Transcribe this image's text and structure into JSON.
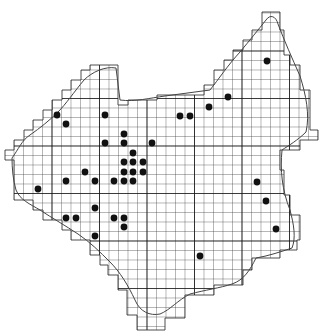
{
  "map": {
    "type": "grid distribution map",
    "cell_size_px": 9.5,
    "grid_color": "#333333",
    "major_line_color": "#111111",
    "border_color": "#444444",
    "dot_color": "#111111",
    "dots": [
      [
        267,
        61
      ],
      [
        228,
        97
      ],
      [
        209,
        107
      ],
      [
        180,
        116
      ],
      [
        190,
        116
      ],
      [
        57,
        115
      ],
      [
        66,
        124
      ],
      [
        105,
        115
      ],
      [
        124,
        134
      ],
      [
        124,
        143
      ],
      [
        105,
        143
      ],
      [
        152,
        143
      ],
      [
        133,
        153
      ],
      [
        124,
        162
      ],
      [
        133,
        162
      ],
      [
        143,
        162
      ],
      [
        124,
        172
      ],
      [
        133,
        172
      ],
      [
        143,
        172
      ],
      [
        85,
        172
      ],
      [
        66,
        181
      ],
      [
        95,
        181
      ],
      [
        114,
        181
      ],
      [
        124,
        181
      ],
      [
        133,
        181
      ],
      [
        38,
        189
      ],
      [
        95,
        208
      ],
      [
        66,
        218
      ],
      [
        76,
        218
      ],
      [
        114,
        218
      ],
      [
        124,
        218
      ],
      [
        124,
        227
      ],
      [
        95,
        236
      ],
      [
        200,
        256
      ],
      [
        257,
        182
      ],
      [
        266,
        201
      ],
      [
        276,
        229
      ]
    ]
  }
}
